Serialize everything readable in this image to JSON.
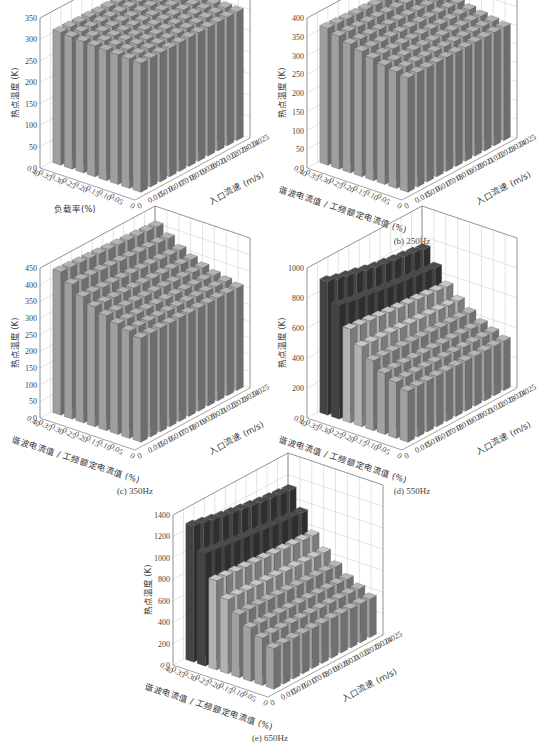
{
  "figure": {
    "panels": [
      {
        "id": "a",
        "caption": "(a) 50Hz",
        "ylabel": "热点温度 (K)",
        "xlabel": "负载率(%)",
        "zlabel": "入口流速 (m/s)"
      },
      {
        "id": "b",
        "caption": "(b) 250Hz",
        "ylabel": "热点温度 (K)",
        "xlabel": "谐波电流值 / 工频额定电流值 (%)",
        "zlabel": "入口流速 (m/s)"
      },
      {
        "id": "c",
        "caption": "(c) 350Hz",
        "ylabel": "热点温度 (K)",
        "xlabel": "谐波电流值 / 工频额定电流值 (%)",
        "zlabel": "入口流速 (m/s)"
      },
      {
        "id": "d",
        "caption": "(d) 550Hz",
        "ylabel": "热点温度 (K)",
        "xlabel": "谐波电流值 / 工频额定电流值 (%)",
        "zlabel": "入口流速 (m/s)"
      },
      {
        "id": "e",
        "caption": "(e) 650Hz",
        "ylabel": "热点温度 (K)",
        "xlabel": "谐波电流值 / 工频额定电流值 (%)",
        "zlabel": "入口流速 (m/s)"
      }
    ]
  },
  "chart_data": [
    {
      "type": "bar3d",
      "title": "(a) 50Hz",
      "xlabel": "负载率(%)",
      "ylabel": "入口流速 (m/s)",
      "zlabel": "热点温度 (K)",
      "x_ticks": [
        "0.40",
        "0.35",
        "0.30",
        "0.25",
        "0.20",
        "0.15",
        "0.10",
        "0.05",
        "0"
      ],
      "y_ticks": [
        "0",
        "0.015",
        "0.016",
        "0.017",
        "0.018",
        "0.019",
        "0.020",
        "0.021",
        "0.022",
        "0.023",
        "0.024",
        "0.025"
      ],
      "z_ticks": [
        0,
        50,
        100,
        150,
        200,
        250,
        300,
        350
      ],
      "zlim": [
        0,
        350
      ],
      "rows": [
        "0.40",
        "0.30",
        "0.20",
        "0.10"
      ],
      "cols": [
        "0.015",
        "0.016",
        "0.017",
        "0.018",
        "0.019",
        "0.020",
        "0.021",
        "0.022",
        "0.023",
        "0.024",
        "0.025"
      ],
      "values": [
        [
          310,
          310,
          309,
          309,
          308,
          308,
          307,
          307,
          306,
          306,
          305
        ],
        [
          306,
          306,
          305,
          305,
          305,
          304,
          304,
          304,
          303,
          303,
          303
        ],
        [
          303,
          303,
          303,
          302,
          302,
          302,
          302,
          301,
          301,
          301,
          301
        ],
        [
          301,
          301,
          301,
          300,
          300,
          300,
          300,
          300,
          300,
          300,
          300
        ]
      ]
    },
    {
      "type": "bar3d",
      "title": "(b) 250Hz",
      "xlabel": "谐波电流值 / 工频额定电流值 (%)",
      "ylabel": "入口流速 (m/s)",
      "zlabel": "热点温度 (K)",
      "x_ticks": [
        "0.40",
        "0.35",
        "0.30",
        "0.25",
        "0.20",
        "0.15",
        "0.10",
        "0.05",
        "0"
      ],
      "y_ticks": [
        "0",
        "0.015",
        "0.016",
        "0.017",
        "0.018",
        "0.019",
        "0.020",
        "0.021",
        "0.022",
        "0.023",
        "0.024",
        "0.025"
      ],
      "z_ticks": [
        0,
        50,
        100,
        150,
        200,
        250,
        300,
        350,
        400
      ],
      "zlim": [
        0,
        400
      ],
      "rows": [
        "0.40",
        "0.30",
        "0.20",
        "0.10"
      ],
      "cols": [
        "0.015",
        "0.016",
        "0.017",
        "0.018",
        "0.019",
        "0.020",
        "0.021",
        "0.022",
        "0.023",
        "0.024",
        "0.025"
      ],
      "values": [
        [
          365,
          364,
          362,
          361,
          360,
          358,
          357,
          356,
          355,
          354,
          353
        ],
        [
          340,
          339,
          338,
          337,
          336,
          335,
          334,
          333,
          332,
          331,
          330
        ],
        [
          320,
          319,
          318,
          318,
          317,
          316,
          316,
          315,
          314,
          314,
          313
        ],
        [
          305,
          305,
          304,
          304,
          304,
          303,
          303,
          303,
          302,
          302,
          302
        ]
      ]
    },
    {
      "type": "bar3d",
      "title": "(c) 350Hz",
      "xlabel": "谐波电流值 / 工频额定电流值 (%)",
      "ylabel": "入口流速 (m/s)",
      "zlabel": "热点温度 (K)",
      "x_ticks": [
        "0.40",
        "0.35",
        "0.30",
        "0.25",
        "0.20",
        "0.15",
        "0.10",
        "0.05",
        "0"
      ],
      "y_ticks": [
        "0",
        "0.015",
        "0.016",
        "0.017",
        "0.018",
        "0.019",
        "0.020",
        "0.021",
        "0.022",
        "0.023",
        "0.024",
        "0.025"
      ],
      "z_ticks": [
        0,
        50,
        100,
        150,
        200,
        250,
        300,
        350,
        400,
        450
      ],
      "zlim": [
        0,
        450
      ],
      "rows": [
        "0.40",
        "0.30",
        "0.20",
        "0.10"
      ],
      "cols": [
        "0.015",
        "0.016",
        "0.017",
        "0.018",
        "0.019",
        "0.020",
        "0.021",
        "0.022",
        "0.023",
        "0.024",
        "0.025"
      ],
      "values": [
        [
          430,
          428,
          426,
          424,
          422,
          420,
          418,
          416,
          414,
          412,
          410
        ],
        [
          370,
          368,
          366,
          365,
          363,
          362,
          360,
          359,
          358,
          356,
          355
        ],
        [
          335,
          334,
          333,
          332,
          331,
          330,
          329,
          328,
          327,
          326,
          325
        ],
        [
          312,
          311,
          311,
          310,
          310,
          309,
          309,
          308,
          308,
          307,
          307
        ]
      ]
    },
    {
      "type": "bar3d",
      "title": "(d) 550Hz",
      "xlabel": "谐波电流值 / 工频额定电流值 (%)",
      "ylabel": "入口流速 (m/s)",
      "zlabel": "热点温度 (K)",
      "x_ticks": [
        "0.40",
        "0.35",
        "0.30",
        "0.25",
        "0.20",
        "0.15",
        "0.10",
        "0.05",
        "0"
      ],
      "y_ticks": [
        "0",
        "0.015",
        "0.016",
        "0.017",
        "0.018",
        "0.019",
        "0.020",
        "0.021",
        "0.022",
        "0.023",
        "0.024",
        "0.025"
      ],
      "z_ticks": [
        0,
        200,
        400,
        600,
        800,
        1000
      ],
      "zlim": [
        0,
        1000
      ],
      "rows": [
        "0.40",
        "0.30",
        "0.20",
        "0.10"
      ],
      "cols": [
        "0.015",
        "0.016",
        "0.017",
        "0.018",
        "0.019",
        "0.020",
        "0.021",
        "0.022",
        "0.023",
        "0.024",
        "0.025"
      ],
      "values": [
        [
          890,
          870,
          855,
          840,
          825,
          810,
          800,
          790,
          780,
          770,
          760
        ],
        [
          580,
          575,
          570,
          565,
          560,
          555,
          550,
          545,
          540,
          535,
          530
        ],
        [
          420,
          418,
          416,
          414,
          412,
          410,
          408,
          406,
          404,
          402,
          400
        ],
        [
          340,
          339,
          338,
          337,
          336,
          335,
          334,
          333,
          332,
          331,
          330
        ]
      ]
    },
    {
      "type": "bar3d",
      "title": "(e) 650Hz",
      "xlabel": "谐波电流值 / 工频额定电流值 (%)",
      "ylabel": "入口流速 (m/s)",
      "zlabel": "热点温度 (K)",
      "x_ticks": [
        "0.40",
        "0.35",
        "0.30",
        "0.25",
        "0.20",
        "0.15",
        "0.10",
        "0.05",
        "0"
      ],
      "y_ticks": [
        "0",
        "0.015",
        "0.016",
        "0.017",
        "0.018",
        "0.019",
        "0.020",
        "0.021",
        "0.022",
        "0.023",
        "0.024",
        "0.025"
      ],
      "z_ticks": [
        0,
        200,
        400,
        600,
        800,
        1000,
        1200,
        1400
      ],
      "zlim": [
        0,
        1400
      ],
      "rows": [
        "0.40",
        "0.30",
        "0.20",
        "0.10"
      ],
      "cols": [
        "0.015",
        "0.016",
        "0.017",
        "0.018",
        "0.019",
        "0.020",
        "0.021",
        "0.022",
        "0.023",
        "0.024",
        "0.025"
      ],
      "values": [
        [
          1270,
          1250,
          1230,
          1210,
          1195,
          1180,
          1165,
          1150,
          1140,
          1130,
          1120
        ],
        [
          760,
          755,
          750,
          745,
          740,
          735,
          730,
          725,
          720,
          715,
          710
        ],
        [
          520,
          517,
          514,
          511,
          508,
          505,
          502,
          499,
          496,
          493,
          490
        ],
        [
          380,
          378,
          376,
          374,
          372,
          370,
          368,
          366,
          364,
          362,
          360
        ]
      ]
    }
  ]
}
